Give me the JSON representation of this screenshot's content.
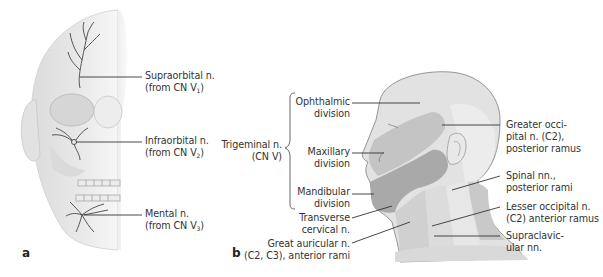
{
  "figure": {
    "panels": [
      {
        "id": "a",
        "letter": "a"
      },
      {
        "id": "b",
        "letter": "b"
      }
    ]
  },
  "panel_a": {
    "letter": "a",
    "labels": [
      {
        "name": "Supraorbital n.",
        "origin_prefix": "(from CN V",
        "origin_sub": "1",
        "origin_suffix": ")"
      },
      {
        "name": "Infraorbital n.",
        "origin_prefix": "(from CN V",
        "origin_sub": "2",
        "origin_suffix": ")"
      },
      {
        "name": "Mental n.",
        "origin_prefix": "(from CN V",
        "origin_sub": "3",
        "origin_suffix": ")"
      }
    ]
  },
  "panel_b": {
    "letter": "b",
    "trigeminal": {
      "line1": "Trigeminal n.",
      "line2": "(CN V)"
    },
    "left_labels": [
      {
        "line1": "Ophthalmic",
        "line2": "division"
      },
      {
        "line1": "Maxillary",
        "line2": "division"
      },
      {
        "line1": "Mandibular",
        "line2": "division"
      },
      {
        "line1": "Transverse",
        "line2": "cervical n."
      },
      {
        "line1": "Great auricular n.",
        "line2": "(C2, C3), anterior rami"
      }
    ],
    "right_labels": [
      {
        "line1": "Greater occi-",
        "line2": "pital n. (C2),",
        "line3": "posterior ramus"
      },
      {
        "line1": "Spinal nn.,",
        "line2": "posterior rami"
      },
      {
        "line1": "Lesser occipital n.",
        "line2": "(C2) anterior ramus"
      },
      {
        "line1": "Supraclavic-",
        "line2": "ular nn."
      }
    ]
  },
  "colors": {
    "ophthalmic": "#e2e2e2",
    "maxillary": "#c4c4c4",
    "mandibular": "#a9a9a9",
    "cervical": "#d6d6d6",
    "posterior": "#bdbdbd",
    "outline": "#8a8a8a",
    "leader": "#333333",
    "nerve": "#555555"
  }
}
